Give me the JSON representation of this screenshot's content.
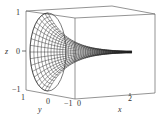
{
  "chart_data": {
    "type": "surface3d",
    "title": "",
    "xlabel": "x",
    "ylabel": "y",
    "zlabel": "z",
    "x_ticks": [
      "0",
      "2"
    ],
    "y_ticks": [
      "1",
      "0",
      "−1"
    ],
    "z_ticks": [
      "1",
      "0",
      "−1"
    ],
    "xlim": [
      0,
      2.8
    ],
    "ylim": [
      -1,
      1
    ],
    "zlim": [
      -1,
      1
    ],
    "surface": {
      "mesh": "wireframe",
      "radius_at_x0": 1,
      "radius_trend": "decays toward 0 as x increases",
      "tip_x": 2.2
    },
    "colors": {
      "mesh": "#222222",
      "box": "#555555",
      "background": "#ffffff"
    }
  },
  "labels": {
    "x_axis": "x",
    "y_axis": "y",
    "z_axis": "z",
    "x_tick_0": "0",
    "x_tick_2": "2",
    "y_tick_1": "1",
    "y_tick_0": "0",
    "y_tick_m1": "−1",
    "z_tick_1": "1",
    "z_tick_0": "0",
    "z_tick_m1": "−1"
  }
}
